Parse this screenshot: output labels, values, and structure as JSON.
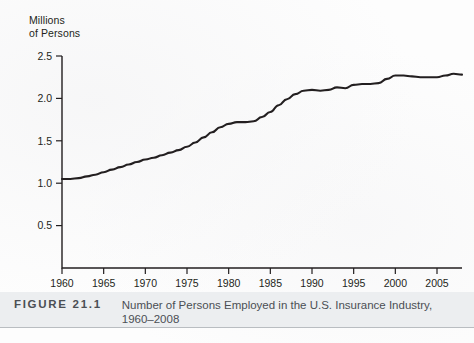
{
  "figure": {
    "number_label": "FIGURE 21.1",
    "caption": "Number of Persons Employed in the U.S. Insurance Industry,\n1960–2008"
  },
  "axis_title": "Millions\nof Persons",
  "chart_data": {
    "type": "line",
    "title": "Number of Persons Employed in the U.S. Insurance Industry, 1960–2008",
    "xlabel": "",
    "ylabel": "Millions of Persons",
    "xlim": [
      1960,
      2008
    ],
    "ylim": [
      0,
      2.5
    ],
    "grid": false,
    "legend": "none",
    "y_ticks": [
      "0.5",
      "1.0",
      "1.5",
      "2.0",
      "2.5"
    ],
    "y_tick_values": [
      0.5,
      1.0,
      1.5,
      2.0,
      2.5
    ],
    "x_ticks": [
      "1960",
      "1965",
      "1970",
      "1975",
      "1980",
      "1985",
      "1990",
      "1995",
      "2000",
      "2005"
    ],
    "x_tick_values": [
      1960,
      1965,
      1970,
      1975,
      1980,
      1985,
      1990,
      1995,
      2000,
      2005
    ],
    "series": [
      {
        "name": "Persons employed in U.S. insurance industry",
        "x": [
          1960,
          1961,
          1962,
          1963,
          1964,
          1965,
          1966,
          1967,
          1968,
          1969,
          1970,
          1971,
          1972,
          1973,
          1974,
          1975,
          1976,
          1977,
          1978,
          1979,
          1980,
          1981,
          1982,
          1983,
          1984,
          1985,
          1986,
          1987,
          1988,
          1989,
          1990,
          1991,
          1992,
          1993,
          1994,
          1995,
          1996,
          1997,
          1998,
          1999,
          2000,
          2001,
          2002,
          2003,
          2004,
          2005,
          2006,
          2007,
          2008
        ],
        "values": [
          1.05,
          1.05,
          1.06,
          1.08,
          1.1,
          1.13,
          1.16,
          1.19,
          1.22,
          1.25,
          1.28,
          1.3,
          1.33,
          1.36,
          1.39,
          1.43,
          1.48,
          1.54,
          1.6,
          1.66,
          1.7,
          1.72,
          1.72,
          1.73,
          1.78,
          1.84,
          1.92,
          1.99,
          2.05,
          2.09,
          2.1,
          2.09,
          2.1,
          2.13,
          2.12,
          2.16,
          2.17,
          2.17,
          2.18,
          2.23,
          2.27,
          2.27,
          2.26,
          2.25,
          2.25,
          2.25,
          2.27,
          2.29,
          2.28
        ]
      }
    ]
  }
}
